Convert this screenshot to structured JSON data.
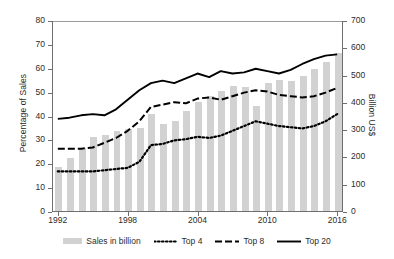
{
  "chart_data": {
    "type": "bar",
    "title": "",
    "xlabel": "",
    "ylabel": "Percentage of Sales",
    "y2label": "Billion US$",
    "ylim": [
      0,
      80
    ],
    "y2lim": [
      0,
      700
    ],
    "yticks": [
      0,
      10,
      20,
      30,
      40,
      50,
      60,
      70,
      80
    ],
    "y2ticks": [
      0,
      100,
      200,
      300,
      400,
      500,
      600,
      700
    ],
    "xticks": [
      "1992",
      "1998",
      "2004",
      "2010",
      "2016"
    ],
    "grid": false,
    "legend_position": "bottom",
    "categories": [
      "1992",
      "1993",
      "1994",
      "1995",
      "1996",
      "1997",
      "1998",
      "1999",
      "2000",
      "2001",
      "2002",
      "2003",
      "2004",
      "2005",
      "2006",
      "2007",
      "2008",
      "2009",
      "2010",
      "2011",
      "2012",
      "2013",
      "2014",
      "2015",
      "2016"
    ],
    "series": [
      {
        "name": "Sales in billion",
        "type": "bar",
        "axis": "right",
        "unit": "Billion US$",
        "values": [
          160,
          195,
          230,
          270,
          280,
          295,
          300,
          305,
          355,
          320,
          330,
          365,
          400,
          420,
          440,
          460,
          455,
          385,
          470,
          480,
          475,
          495,
          520,
          545,
          580
        ]
      },
      {
        "name": "Top 4",
        "type": "line",
        "style": "dotted",
        "axis": "left",
        "unit": "Percentage of Sales",
        "values": [
          17,
          17,
          17,
          17,
          17.5,
          18,
          18.5,
          21,
          28,
          28.5,
          30,
          30.5,
          31.5,
          31,
          32,
          34,
          36,
          38,
          37,
          36,
          35.5,
          35,
          36,
          38,
          41
        ]
      },
      {
        "name": "Top 8",
        "type": "line",
        "style": "dashed",
        "axis": "left",
        "unit": "Percentage of Sales",
        "values": [
          26.5,
          26.5,
          26.5,
          27,
          29,
          31,
          34,
          38,
          44,
          45,
          46,
          45.5,
          47.5,
          48,
          47,
          48.5,
          50,
          51,
          50.5,
          49,
          48.5,
          48,
          48.5,
          50,
          52
        ]
      },
      {
        "name": "Top 20",
        "type": "line",
        "style": "solid",
        "axis": "left",
        "unit": "Percentage of Sales",
        "values": [
          39,
          39.5,
          40.5,
          41,
          40.5,
          43,
          47,
          51,
          54,
          55,
          54,
          56,
          58,
          56.5,
          59,
          58,
          58.5,
          60,
          59,
          58,
          59.5,
          62,
          64,
          65.5,
          66
        ]
      }
    ],
    "legend": [
      {
        "label": "Sales in billion",
        "marker": "bar-swatch",
        "color": "#d2d2d2"
      },
      {
        "label": "Top 4",
        "marker": "dotted-line",
        "color": "#000000"
      },
      {
        "label": "Top 8",
        "marker": "dashed-line",
        "color": "#000000"
      },
      {
        "label": "Top 20",
        "marker": "solid-line",
        "color": "#000000"
      }
    ]
  }
}
